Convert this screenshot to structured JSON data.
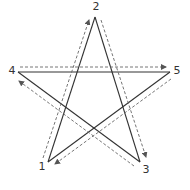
{
  "diagram": {
    "type": "pentagram-stroke-order",
    "stroke_color": "#333333",
    "dash_color": "#666666",
    "points": [
      {
        "id": "1",
        "label": "1",
        "x": 48,
        "y": 162,
        "lx": 42,
        "ly": 170
      },
      {
        "id": "2",
        "label": "2",
        "x": 95,
        "y": 17,
        "lx": 96,
        "ly": 10
      },
      {
        "id": "3",
        "label": "3",
        "x": 140,
        "y": 162,
        "lx": 146,
        "ly": 173
      },
      {
        "id": "4",
        "label": "4",
        "x": 18,
        "y": 72,
        "lx": 12,
        "ly": 74
      },
      {
        "id": "5",
        "label": "5",
        "x": 170,
        "y": 72,
        "lx": 177,
        "ly": 74
      }
    ],
    "strokes": [
      {
        "from": "1",
        "to": "2"
      },
      {
        "from": "2",
        "to": "3"
      },
      {
        "from": "3",
        "to": "4"
      },
      {
        "from": "4",
        "to": "5"
      },
      {
        "from": "5",
        "to": "1"
      }
    ],
    "arrows": [
      {
        "from": "1",
        "to": "2",
        "x1": 43,
        "y1": 158,
        "x2": 89,
        "y2": 20
      },
      {
        "from": "2",
        "to": "3",
        "x1": 101,
        "y1": 20,
        "x2": 146,
        "y2": 157
      },
      {
        "from": "3",
        "to": "4",
        "x1": 134,
        "y1": 166,
        "x2": 19,
        "y2": 81
      },
      {
        "from": "4",
        "to": "5",
        "x1": 20,
        "y1": 67,
        "x2": 166,
        "y2": 67
      },
      {
        "from": "5",
        "to": "1",
        "x1": 171,
        "y1": 79,
        "x2": 55,
        "y2": 164
      }
    ]
  }
}
